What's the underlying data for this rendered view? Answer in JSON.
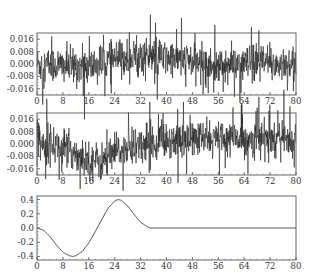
{
  "chart_data": [
    {
      "type": "line",
      "title": "",
      "description": "Noisy signal panel 1 (dense random series around 0, slight upward drift mid-range)",
      "xlabel": "",
      "ylabel": "",
      "xlim": [
        0,
        80
      ],
      "ylim": [
        -0.02,
        0.02
      ],
      "xticks": [
        0,
        8,
        16,
        24,
        32,
        40,
        48,
        56,
        64,
        72,
        80
      ],
      "yticks": [
        0.016,
        0.008,
        0.0,
        -0.008,
        -0.016
      ],
      "ytick_labels": [
        "0.016",
        "0.008",
        "0.000",
        "-0.008",
        "-0.016"
      ],
      "grid": false,
      "noise_std": 0.008,
      "trend": {
        "x": [
          0,
          16,
          24,
          32,
          48,
          56,
          64,
          80
        ],
        "y": [
          0.0,
          -0.002,
          0.003,
          0.005,
          0.002,
          -0.002,
          0.0,
          0.0
        ]
      }
    },
    {
      "type": "line",
      "title": "",
      "description": "Noisy signal panel 2 (dense random series with a dip near x≈16-24)",
      "xlabel": "",
      "ylabel": "",
      "xlim": [
        0,
        80
      ],
      "ylim": [
        -0.02,
        0.02
      ],
      "xticks": [
        0,
        8,
        16,
        24,
        32,
        40,
        48,
        56,
        64,
        72,
        80
      ],
      "yticks": [
        0.016,
        0.008,
        0.0,
        -0.008,
        -0.016
      ],
      "ytick_labels": [
        "0.016",
        "0.008",
        "0.000",
        "-0.008",
        "-0.016"
      ],
      "grid": false,
      "noise_std": 0.008,
      "trend": {
        "x": [
          0,
          8,
          16,
          20,
          24,
          32,
          40,
          80
        ],
        "y": [
          0.003,
          -0.002,
          -0.01,
          -0.012,
          -0.006,
          0.0,
          0.003,
          0.004
        ]
      }
    },
    {
      "type": "line",
      "title": "",
      "description": "Smooth wavelet: dips to -0.4 near x≈11, peaks at 0.4 near x≈25, flat 0 after x≈35",
      "xlabel": "",
      "ylabel": "",
      "xlim": [
        0,
        80
      ],
      "ylim": [
        -0.45,
        0.45
      ],
      "xticks": [
        0,
        8,
        16,
        24,
        32,
        40,
        48,
        56,
        64,
        72,
        80
      ],
      "yticks": [
        0.4,
        0.2,
        0.0,
        -0.2,
        -0.4
      ],
      "ytick_labels": [
        "0.4",
        "0.2",
        "0.0",
        "-0.2",
        "-0.4"
      ],
      "grid": false,
      "x": [
        0,
        2,
        4,
        6,
        8,
        10,
        11,
        12,
        14,
        16,
        18,
        20,
        22,
        24,
        25,
        26,
        28,
        30,
        32,
        34,
        35,
        40,
        48,
        56,
        64,
        72,
        80
      ],
      "y": [
        0.0,
        -0.03,
        -0.12,
        -0.24,
        -0.34,
        -0.39,
        -0.4,
        -0.39,
        -0.33,
        -0.21,
        -0.05,
        0.12,
        0.28,
        0.38,
        0.4,
        0.39,
        0.31,
        0.19,
        0.08,
        0.02,
        0.0,
        0.0,
        0.0,
        0.0,
        0.0,
        0.0,
        0.0
      ]
    }
  ]
}
